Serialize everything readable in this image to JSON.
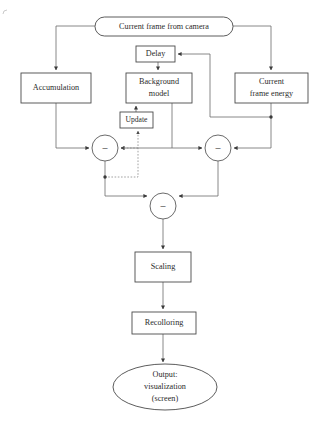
{
  "diagram": {
    "canvas": {
      "width": 318,
      "height": 426
    },
    "colors": {
      "background": "#ffffff",
      "stroke": "#6b6b6b",
      "node_stroke": "#4a4a4a",
      "text": "#2b2b2b",
      "dotted_stroke": "#8a8a8a",
      "junction": "#3a3a3a"
    },
    "nodes": {
      "source": {
        "label": "Current frame from camera",
        "shape": "rounded-rectangle",
        "x": 95,
        "y": 17,
        "width": 138,
        "height": 19
      },
      "delay": {
        "label": "Delay",
        "shape": "rectangle",
        "x": 136,
        "y": 46,
        "width": 39,
        "height": 16
      },
      "accumulation": {
        "label": "Accumulation",
        "shape": "rectangle",
        "x": 21,
        "y": 73,
        "width": 70,
        "height": 30
      },
      "background_model": {
        "label_line1": "Background",
        "label_line2": "model",
        "shape": "rectangle",
        "x": 126,
        "y": 73,
        "width": 66,
        "height": 30
      },
      "current_frame_energy": {
        "label_line1": "Current",
        "label_line2": "frame energy",
        "shape": "rectangle",
        "x": 235,
        "y": 73,
        "width": 73,
        "height": 30
      },
      "update": {
        "label": "Update",
        "shape": "rectangle",
        "x": 120,
        "y": 112,
        "width": 33,
        "height": 16
      },
      "scaling": {
        "label": "Scaling",
        "shape": "rectangle",
        "x": 135,
        "y": 252,
        "width": 56,
        "height": 30
      },
      "recolloring": {
        "label": "Recolloring",
        "shape": "rectangle",
        "x": 132,
        "y": 312,
        "width": 64,
        "height": 22
      },
      "output": {
        "label_line1": "Output:",
        "label_line2": "visualization",
        "label_line3": "(screen)",
        "shape": "ellipse",
        "cx": 165,
        "cy": 387,
        "rx": 52,
        "ry": 23
      }
    },
    "operators": [
      {
        "name": "subtract-left",
        "symbol": "–",
        "cx": 105,
        "cy": 148,
        "r": 13
      },
      {
        "name": "subtract-right",
        "symbol": "–",
        "cx": 218,
        "cy": 148,
        "r": 13
      },
      {
        "name": "subtract-bottom",
        "symbol": "–",
        "cx": 163,
        "cy": 206,
        "r": 13
      }
    ],
    "edges": [
      {
        "name": "source-to-accumulation",
        "style": "solid",
        "from": "source",
        "to": "accumulation"
      },
      {
        "name": "source-to-current-frame-energy",
        "style": "solid",
        "from": "source",
        "to": "current_frame_energy"
      },
      {
        "name": "delay-to-background-model",
        "style": "solid",
        "from": "delay",
        "to": "background_model"
      },
      {
        "name": "current-frame-energy-to-delay",
        "style": "solid",
        "from": "current_frame_energy",
        "to": "delay"
      },
      {
        "name": "accumulation-to-subtract-left",
        "style": "solid",
        "from": "accumulation",
        "to": "subtract-left"
      },
      {
        "name": "background-model-to-subtract-left",
        "style": "solid",
        "from": "background_model",
        "to": "subtract-left"
      },
      {
        "name": "background-model-to-subtract-right",
        "style": "solid",
        "from": "background_model",
        "to": "subtract-right"
      },
      {
        "name": "current-frame-energy-to-subtract-right",
        "style": "solid",
        "from": "current_frame_energy",
        "to": "subtract-right"
      },
      {
        "name": "subtract-left-to-update-feedback",
        "style": "dotted",
        "from": "subtract-left",
        "to": "update"
      },
      {
        "name": "update-to-background-model",
        "style": "solid",
        "from": "update",
        "to": "background_model"
      },
      {
        "name": "subtract-left-to-subtract-bottom",
        "style": "solid",
        "from": "subtract-left",
        "to": "subtract-bottom"
      },
      {
        "name": "subtract-right-to-subtract-bottom",
        "style": "solid",
        "from": "subtract-right",
        "to": "subtract-bottom"
      },
      {
        "name": "subtract-bottom-to-scaling",
        "style": "solid",
        "from": "subtract-bottom",
        "to": "scaling"
      },
      {
        "name": "scaling-to-recolloring",
        "style": "solid",
        "from": "scaling",
        "to": "recolloring"
      },
      {
        "name": "recolloring-to-output",
        "style": "solid",
        "from": "recolloring",
        "to": "output"
      }
    ]
  }
}
